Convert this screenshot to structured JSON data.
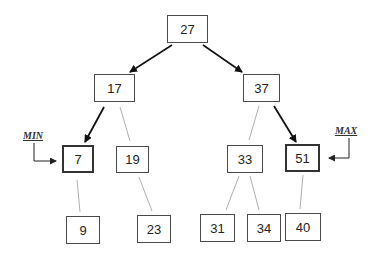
{
  "diagram": {
    "type": "binary-search-tree",
    "nodes": {
      "n27": {
        "value": "27"
      },
      "n17": {
        "value": "17"
      },
      "n37": {
        "value": "37"
      },
      "n7": {
        "value": "7"
      },
      "n19": {
        "value": "19"
      },
      "n33": {
        "value": "33"
      },
      "n51": {
        "value": "51"
      },
      "n9": {
        "value": "9"
      },
      "n23": {
        "value": "23"
      },
      "n31": {
        "value": "31"
      },
      "n34": {
        "value": "34"
      },
      "n40": {
        "value": "40"
      }
    },
    "edges": [
      {
        "from": "27",
        "to": "17",
        "style": "arrow"
      },
      {
        "from": "27",
        "to": "37",
        "style": "arrow"
      },
      {
        "from": "17",
        "to": "7",
        "style": "arrow"
      },
      {
        "from": "17",
        "to": "19",
        "style": "thin"
      },
      {
        "from": "37",
        "to": "33",
        "style": "thin"
      },
      {
        "from": "37",
        "to": "51",
        "style": "arrow"
      },
      {
        "from": "7",
        "to": "9",
        "style": "thin"
      },
      {
        "from": "19",
        "to": "23",
        "style": "thin"
      },
      {
        "from": "33",
        "to": "31",
        "style": "thin"
      },
      {
        "from": "33",
        "to": "34",
        "style": "thin"
      },
      {
        "from": "51",
        "to": "40",
        "style": "thin"
      }
    ],
    "labels": {
      "min": "MIN",
      "max": "MAX"
    }
  }
}
